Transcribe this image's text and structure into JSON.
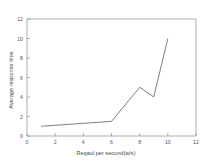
{
  "chart_data": {
    "type": "line",
    "title": "",
    "xlabel": "Reqaul per second(w/s)",
    "ylabel": "Average response time",
    "x": [
      1,
      6,
      8,
      9,
      10
    ],
    "values": [
      1,
      1.5,
      5,
      4,
      10
    ],
    "series": [
      {
        "name": "Average response time",
        "x": [
          1,
          6,
          8,
          9,
          10
        ],
        "values": [
          1,
          1.5,
          5,
          4,
          10
        ]
      }
    ],
    "xlim": [
      0,
      12
    ],
    "ylim": [
      0,
      12
    ],
    "xticks": [
      "0",
      "2",
      "4",
      "6",
      "8",
      "10",
      "12"
    ],
    "yticks": [
      "0",
      "2",
      "4",
      "6",
      "8",
      "10",
      "12"
    ],
    "xtick_values": [
      0,
      2,
      4,
      6,
      8,
      10,
      12
    ],
    "ytick_values": [
      0,
      2,
      4,
      6,
      8,
      10,
      12
    ],
    "grid": false,
    "legend": "none",
    "line_color": "#6e6e6e",
    "axis_color": "#8a8a8a",
    "background": "#ffffff"
  },
  "axes": {
    "x_title": "Reqaul per second(w/s)",
    "y_title": "Average response time"
  },
  "xtick_labels": [
    "0",
    "2",
    "4",
    "6",
    "8",
    "10",
    "12"
  ],
  "ytick_labels": [
    "0",
    "2",
    "4",
    "6",
    "8",
    "10",
    "12"
  ]
}
